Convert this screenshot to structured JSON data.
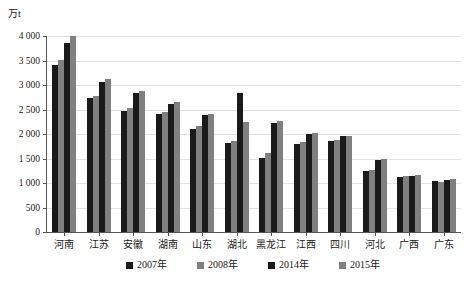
{
  "chart_data": {
    "type": "bar",
    "title": "",
    "subtitle": "",
    "xlabel": "",
    "ylabel": "万t",
    "ylim": [
      0,
      4000
    ],
    "ytick_labels": [
      "4 000",
      "3 500",
      "3 000",
      "2 500",
      "2 000",
      "1 500",
      "1 000",
      "500",
      "0"
    ],
    "ytick_values": [
      4000,
      3500,
      3000,
      2500,
      2000,
      1500,
      1000,
      500,
      0
    ],
    "grid": true,
    "legend_position": "bottom",
    "categories": [
      "河南",
      "江苏",
      "安徽",
      "湖南",
      "山东",
      "湖北",
      "黑龙江",
      "江西",
      "四川",
      "河北",
      "广西",
      "广东"
    ],
    "series": [
      {
        "name": "2007年",
        "color": "#1a1a1a",
        "values": [
          3400,
          2730,
          2460,
          2400,
          2100,
          1820,
          1510,
          1790,
          1850,
          1240,
          1130,
          1040
        ]
      },
      {
        "name": "2008年",
        "color": "#808080",
        "values": [
          3500,
          2780,
          2530,
          2450,
          2170,
          1850,
          1620,
          1830,
          1870,
          1260,
          1140,
          1030
        ]
      },
      {
        "name": "2014年",
        "color": "#1a1a1a",
        "values": [
          3850,
          3070,
          2830,
          2620,
          2380,
          2830,
          2230,
          2010,
          1960,
          1460,
          1150,
          1070
        ]
      },
      {
        "name": "2015年",
        "color": "#808080",
        "values": [
          3990,
          3130,
          2880,
          2660,
          2400,
          2250,
          2260,
          2030,
          1960,
          1480,
          1170,
          1090
        ]
      }
    ]
  },
  "legend": {
    "items": [
      {
        "label": "2007年",
        "color": "#1a1a1a"
      },
      {
        "label": "2008年",
        "color": "#808080"
      },
      {
        "label": "2014年",
        "color": "#1a1a1a"
      },
      {
        "label": "2015年",
        "color": "#808080"
      }
    ]
  },
  "axis": {
    "unit_label": "万t"
  },
  "colors": {
    "dark_bar": "#1a1a1a",
    "gray_bar": "#808080",
    "gridline": "#e2e2e2",
    "axis_line": "#555555",
    "background": "#ffffff"
  }
}
